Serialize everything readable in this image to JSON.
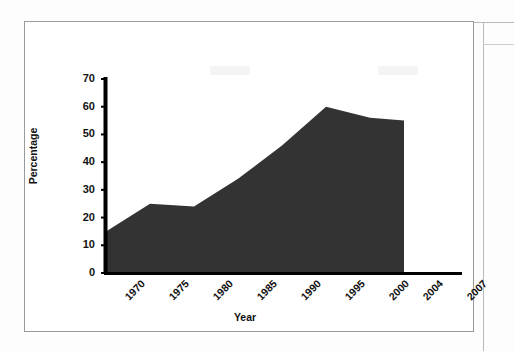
{
  "figure": {
    "background_color": "#ffffff",
    "frame_color": "#9a9a9a"
  },
  "chart_data": {
    "type": "area",
    "title": "",
    "subtitle": "",
    "xlabel": "Year",
    "ylabel": "Percentage",
    "categories": [
      "1970",
      "1975",
      "1980",
      "1985",
      "1990",
      "1995",
      "2000",
      "2004"
    ],
    "values": [
      15,
      25,
      24,
      34,
      46,
      60,
      56,
      55
    ],
    "x_tick_labels": [
      "1970",
      "1975",
      "1980",
      "1985",
      "1990",
      "1995",
      "2000",
      "2004",
      "2007"
    ],
    "y_tick_labels": [
      "0",
      "10",
      "20",
      "30",
      "40",
      "50",
      "60",
      "70"
    ],
    "y_ticks": [
      0,
      10,
      20,
      30,
      40,
      50,
      60,
      70
    ],
    "ylim": [
      0,
      70
    ],
    "grid": false,
    "legend": "none",
    "series": [
      {
        "name": "Percentage",
        "fill_color": "#333333",
        "values": [
          15,
          25,
          24,
          34,
          46,
          60,
          56,
          55
        ]
      }
    ],
    "axis_color": "#000000",
    "x_tick_label_rotation": -45
  }
}
